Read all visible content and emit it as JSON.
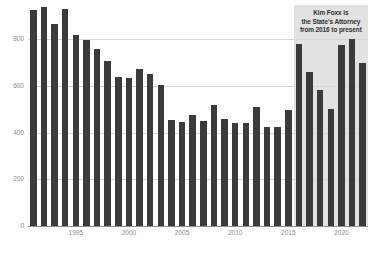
{
  "chart_data": {
    "type": "bar",
    "title": "",
    "subtitle": "",
    "xlabel": "",
    "ylabel": "",
    "ylim": [
      0,
      900
    ],
    "yticks": [
      0,
      200,
      400,
      600,
      800
    ],
    "ytick_labels": [
      "0",
      "200",
      "400",
      "600",
      "800"
    ],
    "xticks": [
      1995,
      2000,
      2005,
      2010,
      2015,
      2020
    ],
    "xtick_labels": [
      "1995",
      "2000",
      "2005",
      "2010",
      "2015",
      "2020"
    ],
    "grid": true,
    "legend": "none",
    "bar_color": "#3b3b3b",
    "background_color": "#ffffff",
    "gridline_color": "#d8d8d8",
    "axis_text_color": "#8a8a8a",
    "categories": [
      "1991",
      "1992",
      "1993",
      "1994",
      "1995",
      "1996",
      "1997",
      "1998",
      "1999",
      "2000",
      "2001",
      "2002",
      "2003",
      "2004",
      "2005",
      "2006",
      "2007",
      "2008",
      "2009",
      "2010",
      "2011",
      "2012",
      "2013",
      "2014",
      "2015",
      "2016",
      "2017",
      "2018",
      "2019",
      "2020",
      "2021",
      "2022"
    ],
    "values": [
      925,
      940,
      865,
      930,
      820,
      797,
      760,
      708,
      640,
      636,
      672,
      650,
      604,
      453,
      447,
      474,
      451,
      518,
      459,
      440,
      442,
      512,
      424,
      425,
      497,
      780,
      660,
      583,
      500,
      775,
      800,
      697
    ],
    "annotations": [
      {
        "name": "kim-foxx-note",
        "lines": [
          "Kim Foxx is",
          "the State's Attorney",
          "from 2016 to present"
        ],
        "shade_start_category": "2016",
        "shade_end_category": "2022",
        "shade_color": "#e2e2e2",
        "text_color": "#2f2f2f"
      }
    ]
  }
}
